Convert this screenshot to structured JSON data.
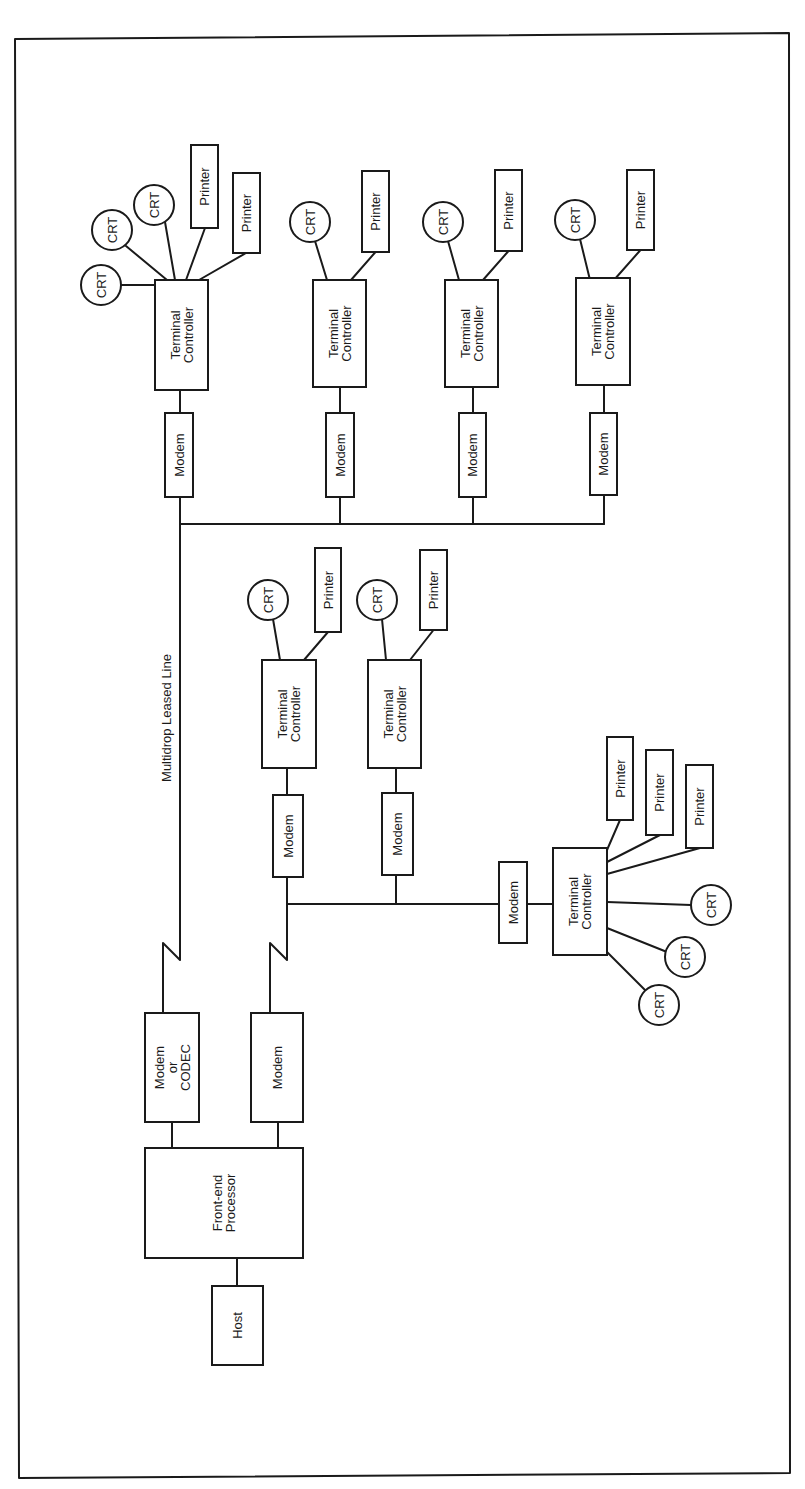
{
  "diagram": {
    "line_color": "#1a1a1a",
    "background": "#ffffff",
    "labels": {
      "host": "Host",
      "fep": [
        "Front-end",
        "Processor"
      ],
      "modem_codec": [
        "Modem",
        "or",
        "CODEC"
      ],
      "modem": "Modem",
      "terminal_controller": [
        "Terminal",
        "Controller"
      ],
      "crt": "CRT",
      "printer": "Printer",
      "leased_line": "Multidrop Leased Line"
    },
    "nodes": [
      {
        "id": "host",
        "type": "host",
        "label": "Host"
      },
      {
        "id": "fep",
        "type": "front-end-processor",
        "label": "Front-end Processor"
      },
      {
        "id": "mc1",
        "type": "modem-or-codec",
        "label": "Modem or CODEC"
      },
      {
        "id": "m0",
        "type": "modem",
        "label": "Modem"
      },
      {
        "id": "g1",
        "type": "terminal-group",
        "crts": 3,
        "printers": 2,
        "bus": "upper"
      },
      {
        "id": "g2",
        "type": "terminal-group",
        "crts": 1,
        "printers": 1,
        "bus": "upper"
      },
      {
        "id": "g3",
        "type": "terminal-group",
        "crts": 1,
        "printers": 1,
        "bus": "upper"
      },
      {
        "id": "g4",
        "type": "terminal-group",
        "crts": 1,
        "printers": 1,
        "bus": "upper"
      },
      {
        "id": "g5",
        "type": "terminal-group",
        "crts": 1,
        "printers": 1,
        "bus": "lower"
      },
      {
        "id": "g6",
        "type": "terminal-group",
        "crts": 1,
        "printers": 1,
        "bus": "lower"
      },
      {
        "id": "g7",
        "type": "terminal-group",
        "crts": 3,
        "printers": 3,
        "bus": "lower"
      }
    ],
    "edges": [
      [
        "host",
        "fep"
      ],
      [
        "fep",
        "mc1"
      ],
      [
        "fep",
        "m0"
      ],
      [
        "mc1",
        "upper-bus"
      ],
      [
        "m0",
        "lower-bus"
      ]
    ]
  }
}
